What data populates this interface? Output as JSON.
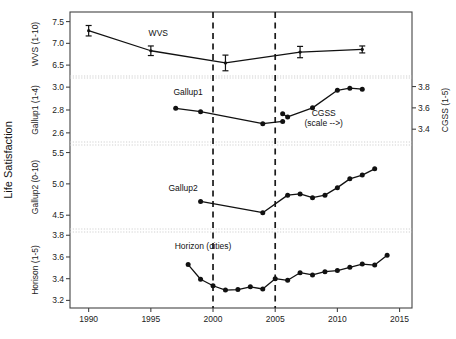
{
  "chart_data": {
    "type": "line",
    "title": "",
    "xlabel": "",
    "ylabel": "Life Satisfaction",
    "xlim": [
      1988.5,
      2016.0
    ],
    "xticks": [
      1990,
      1995,
      2000,
      2005,
      2010,
      2015
    ],
    "xticklabels": [
      "1990",
      "1995",
      "2000",
      "2005",
      "2010",
      "2015"
    ],
    "grid": false,
    "legend_position": "inline-annotations",
    "annotations": [
      {
        "text": "WVS",
        "x": 1995.6,
        "panel": "wvs"
      },
      {
        "text": "Gallup1",
        "x": 1998.0,
        "panel": "gallup1"
      },
      {
        "text": "CGSS",
        "x": 2008.6,
        "panel": "gallup1"
      },
      {
        "text": "(scale -->)",
        "x": 2008.6,
        "panel": "gallup1"
      },
      {
        "text": "Gallup2",
        "x": 1997.5,
        "panel": "gallup2"
      },
      {
        "text": "Horizon (cities)",
        "x": 1998.8,
        "panel": "horizon"
      }
    ],
    "vertical_reference_lines": [
      2000,
      2005
    ],
    "panels": [
      {
        "name": "wvs",
        "ylabel": "WVS (1-10)",
        "ylim": [
          6.25,
          7.72
        ],
        "yticks": [
          6.5,
          7.0,
          7.5
        ],
        "yticklabels": [
          "6.5",
          "7.0",
          "7.5"
        ],
        "series": [
          {
            "name": "WVS",
            "marker": "errorbar",
            "x": [
              1990,
              1995,
              2001,
              2007,
              2012
            ],
            "values": [
              7.29,
              6.83,
              6.55,
              6.8,
              6.86
            ],
            "yerr": [
              0.12,
              0.11,
              0.18,
              0.13,
              0.08
            ]
          }
        ]
      },
      {
        "name": "gallup1",
        "ylabel": "Gallup1 (1-4)",
        "ylim": [
          2.52,
          3.08
        ],
        "yticks": [
          2.6,
          2.8,
          3.0
        ],
        "yticklabels": [
          "2.6",
          "2.8",
          "3.0"
        ],
        "right_ylabel": "CGSS (1-5)",
        "right_ylim": [
          3.28,
          3.88
        ],
        "right_yticks": [
          3.4,
          3.6,
          3.8
        ],
        "right_yticklabels": [
          "3.4",
          "3.6",
          "3.8"
        ],
        "series": [
          {
            "name": "Gallup1",
            "marker": "dot",
            "axis": "left",
            "x": [
              1997,
              1999,
              2004,
              2005.6
            ],
            "values": [
              2.815,
              2.785,
              2.68,
              2.7
            ]
          },
          {
            "name": "CGSS",
            "marker": "dot",
            "axis": "right",
            "x": [
              2005.6,
              2006,
              2008,
              2010,
              2011,
              2012
            ],
            "values": [
              3.545,
              3.515,
              3.6,
              3.765,
              3.785,
              3.775
            ]
          }
        ]
      },
      {
        "name": "gallup2",
        "ylabel": "Gallup2 (0-10)",
        "ylim": [
          4.28,
          5.62
        ],
        "yticks": [
          4.5,
          5.0,
          5.5
        ],
        "yticklabels": [
          "4.5",
          "5.0",
          "5.5"
        ],
        "series": [
          {
            "name": "Gallup2",
            "marker": "dot",
            "x": [
              1999,
              2004,
              2006,
              2007,
              2008,
              2009,
              2010,
              2011,
              2012,
              2013
            ],
            "values": [
              4.72,
              4.54,
              4.82,
              4.84,
              4.78,
              4.82,
              4.94,
              5.08,
              5.14,
              5.24
            ]
          }
        ]
      },
      {
        "name": "horizon",
        "ylabel": "Horison (1-5)",
        "ylim": [
          3.13,
          3.83
        ],
        "yticks": [
          3.2,
          3.4,
          3.6,
          3.8
        ],
        "yticklabels": [
          "3.2",
          "3.4",
          "3.6",
          "3.8"
        ],
        "series": [
          {
            "name": "Horizon (cities)",
            "marker": "dot",
            "x": [
              1998,
              1999,
              2000,
              2001,
              2002,
              2003,
              2004,
              2005,
              2006,
              2007,
              2008,
              2009,
              2010,
              2011,
              2012,
              2013,
              2014
            ],
            "values": [
              3.53,
              3.395,
              3.335,
              3.295,
              3.3,
              3.325,
              3.305,
              3.4,
              3.385,
              3.455,
              3.435,
              3.465,
              3.475,
              3.505,
              3.535,
              3.525,
              3.615
            ]
          }
        ]
      }
    ]
  },
  "colors": {
    "ink": "#111111",
    "frame": "#444444",
    "gridline": "#cccccc",
    "dashed": "#1a1a1a",
    "background": "#ffffff"
  }
}
